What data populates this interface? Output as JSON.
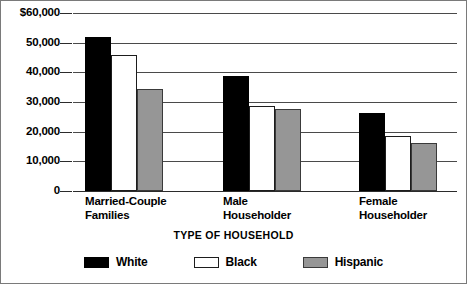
{
  "chart_data": {
    "type": "bar",
    "title": "",
    "xlabel": "TYPE OF HOUSEHOLD",
    "ylabel": "",
    "ylim": [
      0,
      60000
    ],
    "ytick_labels": [
      "$60,000",
      "50,000",
      "40,000",
      "30,000",
      "20,000",
      "10,000",
      "0"
    ],
    "ytick_values": [
      60000,
      50000,
      40000,
      30000,
      20000,
      10000,
      0
    ],
    "grid": true,
    "legend_position": "bottom",
    "categories": [
      "Married-Couple Families",
      "Male Householder",
      "Female Householder"
    ],
    "category_lines": [
      [
        "Married-Couple",
        "Families"
      ],
      [
        "Male",
        "Householder"
      ],
      [
        "Female",
        "Householder"
      ]
    ],
    "series": [
      {
        "name": "White",
        "color": "#000000",
        "values": [
          52000,
          38700,
          26200
        ]
      },
      {
        "name": "Black",
        "color": "#ffffff",
        "values": [
          46000,
          28500,
          18500
        ]
      },
      {
        "name": "Hispanic",
        "color": "#969696",
        "values": [
          34500,
          27500,
          16200
        ]
      }
    ]
  },
  "legend": {
    "items": [
      {
        "label": "White",
        "swatch": "black-filled-swatch"
      },
      {
        "label": "Black",
        "swatch": "white-outline-swatch"
      },
      {
        "label": "Hispanic",
        "swatch": "gray-filled-swatch"
      }
    ]
  }
}
